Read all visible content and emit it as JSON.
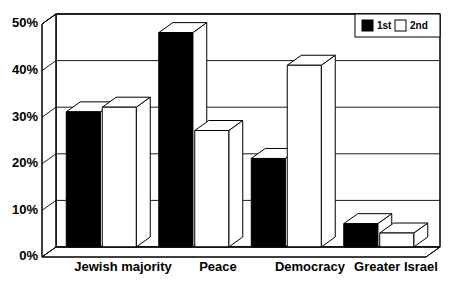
{
  "chart_data": {
    "type": "bar",
    "title": "",
    "subtitle": "",
    "xlabel": "",
    "ylabel": "",
    "categories": [
      "Jewish majority",
      "Peace",
      "Democracy",
      "Greater Israel"
    ],
    "series": [
      {
        "name": "1st",
        "values": [
          29,
          46,
          19,
          5
        ],
        "color": "#000000"
      },
      {
        "name": "2nd",
        "values": [
          30,
          25,
          39,
          3
        ],
        "color": "#ffffff"
      }
    ],
    "ylim": [
      0,
      50
    ],
    "ytick_values": [
      0,
      10,
      20,
      30,
      40,
      50
    ],
    "ytick_labels": [
      "0%",
      "10%",
      "20%",
      "30%",
      "40%",
      "50%"
    ],
    "grid": true,
    "grid_axis": "y",
    "legend_position": "top-right",
    "style_3d": true,
    "value_format": "percent",
    "background_color": "#ffffff",
    "line_color": "#000000"
  },
  "legend": {
    "entries": [
      {
        "label": "1st",
        "swatch": "black-filled-square"
      },
      {
        "label": "2nd",
        "swatch": "white-outlined-square"
      }
    ]
  },
  "axis": {
    "y_ticks": [
      "0%",
      "10%",
      "20%",
      "30%",
      "40%",
      "50%"
    ]
  },
  "categories": [
    "Jewish majority",
    "Peace",
    "Democracy",
    "Greater Israel"
  ]
}
